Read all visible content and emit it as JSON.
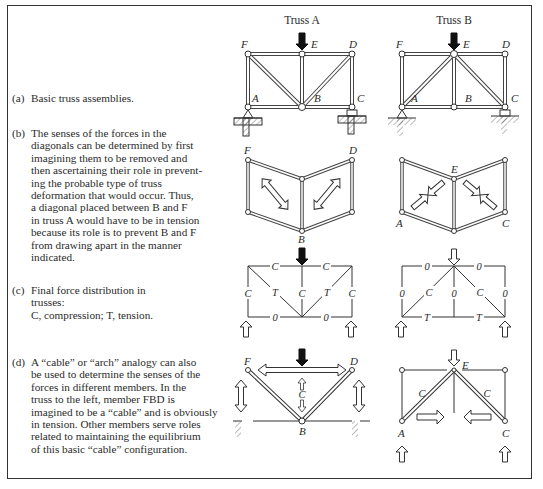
{
  "figure": {
    "columns": [
      {
        "title": "Truss A"
      },
      {
        "title": "Truss B"
      }
    ],
    "captions": [
      {
        "label": "(a)",
        "text": "Basic truss assemblies."
      },
      {
        "label": "(b)",
        "lines": [
          "The senses of the forces in the",
          "diagonals can be determined by first",
          "imagining them to be removed and",
          "then ascertaining their role in prevent-",
          "ing the probable type of truss",
          "deformation that would occur.  Thus,",
          "a diagonal placed between B and F",
          "in truss A would have to be in tension",
          "because its role is to prevent B and F",
          "from drawing apart in the manner",
          "indicated."
        ]
      },
      {
        "label": "(c)",
        "lines": [
          "Final force distribution in",
          "trusses:",
          "C, compression; T, tension."
        ]
      },
      {
        "label": "(d)",
        "lines": [
          "A “cable” or “arch” analogy can also",
          "be used to determine the senses of the",
          "forces in different members.  In the",
          "truss to the left, member FBD is",
          "imagined to be a “cable” and is obviously",
          "in tension.  Other members serve roles",
          "related to maintaining the equilibrium",
          "of this basic “cable” configuration."
        ]
      }
    ],
    "node_labels": {
      "A": "A",
      "B": "B",
      "C": "C",
      "D": "D",
      "E": "E",
      "F": "F"
    },
    "force_labels": {
      "compression": "C",
      "tension": "T",
      "zero": "0"
    },
    "colors": {
      "ink": "#2a2a2a",
      "line": "#333333",
      "background": "#ffffff"
    }
  }
}
